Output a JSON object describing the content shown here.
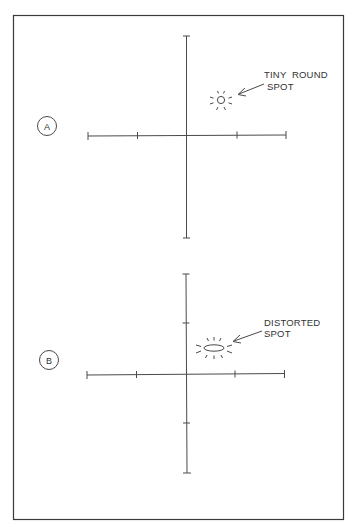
{
  "figure": {
    "panels": [
      {
        "id": "A",
        "label": "A",
        "annotation": {
          "line1": "TINY  ROUND",
          "line2": "SPOT"
        },
        "spot_shape": "circle",
        "x_ticks": 4,
        "y_ticks": 0
      },
      {
        "id": "B",
        "label": "B",
        "annotation": {
          "line1": "DISTORTED",
          "line2": "SPOT"
        },
        "spot_shape": "ellipse",
        "x_ticks": 4,
        "y_ticks": 2
      }
    ],
    "colors": {
      "line": "#3a3a3a",
      "background": "#ffffff"
    }
  }
}
